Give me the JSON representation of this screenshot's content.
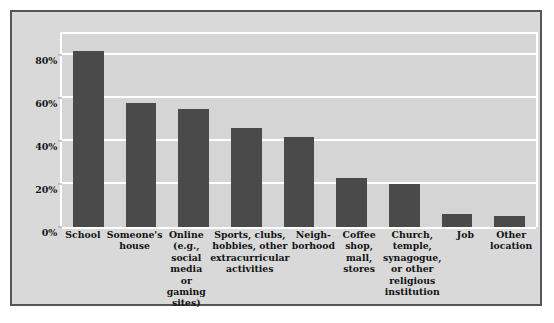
{
  "chart_data": {
    "type": "bar",
    "title": "",
    "subtitle": "",
    "xlabel": "",
    "ylabel": "",
    "ylim": [
      0,
      90
    ],
    "grid": true,
    "legend": false,
    "gridlines_on": "y",
    "categories": [
      "School",
      "Someone's house",
      "Online (e.g., social media or gaming sites)",
      "Sports, clubs, hobbies, other extracurricular activities",
      "Neigh-borhood",
      "Coffee shop, mall, stores",
      "Church, temple, synagogue, or other religious institution",
      "Job",
      "Other location"
    ],
    "values": [
      82,
      58,
      55,
      46,
      42,
      23,
      20,
      6,
      5
    ],
    "ytick_labels": [
      "0%",
      "20%",
      "40%",
      "60%",
      "80%"
    ],
    "ytick_values": [
      0,
      20,
      40,
      60,
      80
    ],
    "bar_color": "#4a4a4a",
    "plot_background": "#d5d5d5",
    "panel_background": "#d9d9d9",
    "gridline_color": "#ffffff",
    "border_color": "#55565a",
    "text_color": "#131313"
  },
  "caption": {
    "text": ""
  }
}
